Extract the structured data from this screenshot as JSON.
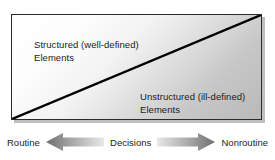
{
  "diagram": {
    "regions": [
      {
        "name": "structured",
        "label": "Structured (well-defined)\nElements",
        "position": "upper-left"
      },
      {
        "name": "unstructured",
        "label": "Unstructured (ill-defined)\nElements",
        "position": "lower-right"
      }
    ],
    "axis": {
      "left_label": "Routine",
      "center_label": "Decisions",
      "right_label": "Nonroutine",
      "left_arrow_icon": "arrow-left-icon",
      "right_arrow_icon": "arrow-right-icon"
    },
    "colors": {
      "border": "#2b2b2b",
      "divider_line": "#000000",
      "fill_light": "#ffffff",
      "fill_dark": "#b9b9b9",
      "text": "#1c1c1c",
      "shadow": "#282828",
      "arrow_dark": "#6e6e6e",
      "arrow_light": "#e4e4e4"
    }
  }
}
